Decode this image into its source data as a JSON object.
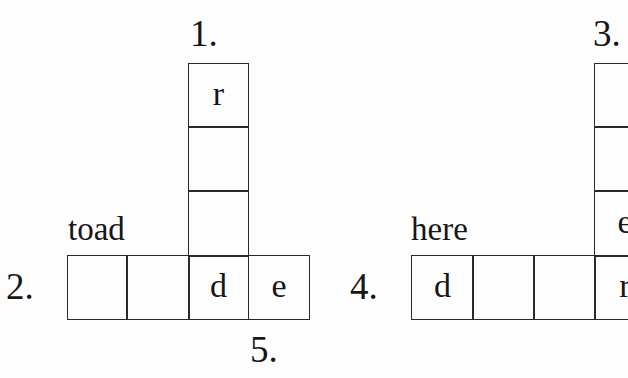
{
  "puzzle_left": {
    "labels": {
      "across_number": "2.",
      "down_number": "1.",
      "below_number": "5."
    },
    "clue_word": "toad",
    "down_cells": [
      "r",
      "",
      ""
    ],
    "across_cells": [
      "",
      "",
      "d",
      "e"
    ]
  },
  "puzzle_right": {
    "labels": {
      "across_number": "4.",
      "down_number": "3."
    },
    "clue_word": "here",
    "down_cells": [
      "",
      "",
      "e"
    ],
    "across_cells": [
      "d",
      "",
      "",
      "r"
    ]
  }
}
